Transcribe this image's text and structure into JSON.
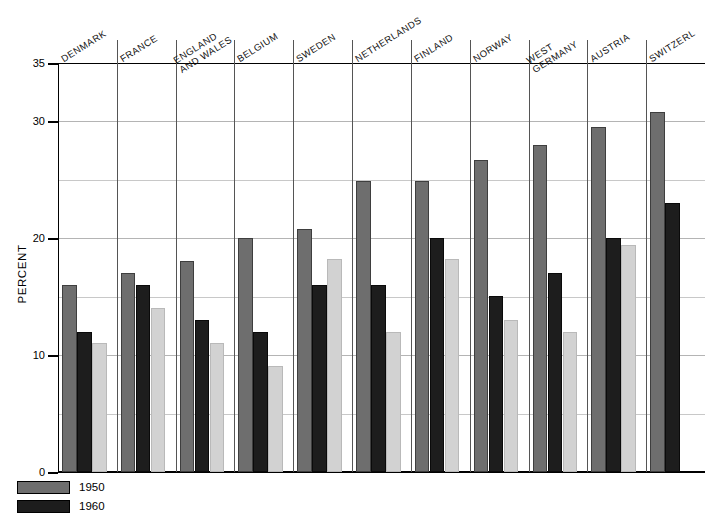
{
  "chart_data": {
    "type": "bar",
    "title": "",
    "xlabel": "",
    "ylabel": "PERCENT",
    "ylim": [
      0,
      35
    ],
    "yticks": [
      0,
      10,
      20,
      30,
      35
    ],
    "ytick_labels": [
      "0",
      "10",
      "20",
      "30",
      "35"
    ],
    "minor_gridlines": [
      5,
      15,
      25
    ],
    "grid": true,
    "legend_position": "bottom-left",
    "categories": [
      "DENMARK",
      "FRANCE",
      "ENGLAND\nAND WALES",
      "BELGIUM",
      "SWEDEN",
      "NETHERLANDS",
      "FINLAND",
      "NORWAY",
      "WEST\nGERMANY",
      "AUSTRIA",
      "SWITZERL"
    ],
    "series": [
      {
        "name": "1950",
        "color": "#6e6e6e",
        "values": [
          16.0,
          17.0,
          18.1,
          20.0,
          20.8,
          24.9,
          24.9,
          26.7,
          28.0,
          29.5,
          30.8
        ]
      },
      {
        "name": "1960",
        "color": "#1d1d1d",
        "values": [
          12.0,
          16.0,
          13.0,
          12.0,
          16.0,
          16.0,
          20.0,
          15.1,
          17.0,
          20.0,
          23.0
        ]
      },
      {
        "name": "",
        "color": "#d2d2d2",
        "values": [
          11.0,
          14.0,
          11.0,
          9.1,
          18.2,
          12.0,
          18.2,
          13.0,
          12.0,
          19.4,
          null
        ]
      }
    ]
  },
  "legend": {
    "entries": [
      {
        "label": "1950",
        "series": 0
      },
      {
        "label": "1960",
        "series": 1
      }
    ]
  }
}
